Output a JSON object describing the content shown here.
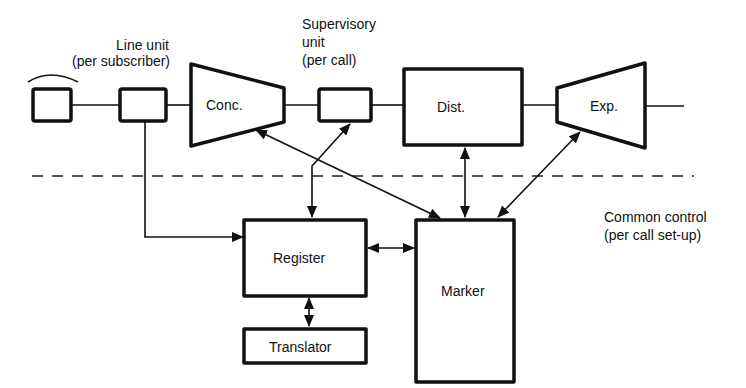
{
  "diagram": {
    "labels": {
      "line_unit": "Line unit",
      "line_unit_sub": "(per subscriber)",
      "supervisory": "Supervisory",
      "supervisory_unit": "unit",
      "supervisory_sub": "(per call)",
      "conc": "Conc.",
      "dist": "Dist.",
      "exp": "Exp.",
      "register": "Register",
      "marker": "Marker",
      "translator": "Translator",
      "common_control": "Common control",
      "common_control_sub": "(per call set-up)"
    },
    "connections": [
      {
        "from": "telephone",
        "to": "line-unit",
        "type": "line"
      },
      {
        "from": "line-unit",
        "to": "concentrator",
        "type": "line"
      },
      {
        "from": "concentrator",
        "to": "supervisory-unit",
        "type": "line"
      },
      {
        "from": "supervisory-unit",
        "to": "distributor",
        "type": "line"
      },
      {
        "from": "distributor",
        "to": "expander",
        "type": "line"
      },
      {
        "from": "line-unit",
        "to": "register",
        "type": "arrow"
      },
      {
        "from": "supervisory-unit",
        "to": "register",
        "type": "bidirectional"
      },
      {
        "from": "concentrator",
        "to": "marker",
        "type": "bidirectional"
      },
      {
        "from": "distributor",
        "to": "marker",
        "type": "bidirectional"
      },
      {
        "from": "expander",
        "to": "marker",
        "type": "bidirectional"
      },
      {
        "from": "register",
        "to": "marker",
        "type": "bidirectional"
      },
      {
        "from": "register",
        "to": "translator",
        "type": "bidirectional"
      }
    ]
  }
}
